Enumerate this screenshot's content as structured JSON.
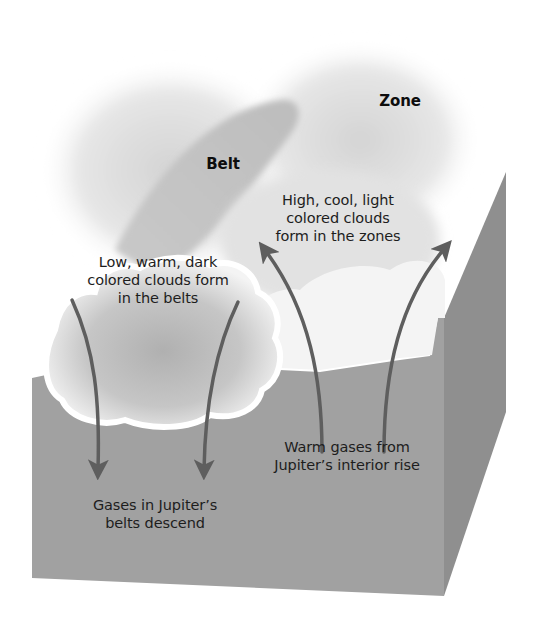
{
  "diagram": {
    "title_labels": {
      "belt": "Belt",
      "zone": "Zone"
    },
    "annotations": {
      "belt_clouds": "Low, warm, dark\ncolored clouds form\nin the belts",
      "zone_clouds": "High, cool, light\ncolored clouds\nform in the zones",
      "belt_gases": "Gases in Jupiter’s\nbelts descend",
      "zone_gases": "Warm gases from\nJupiter’s interior rise"
    },
    "arrows": [
      {
        "id": "belt-left",
        "direction": "down"
      },
      {
        "id": "belt-right",
        "direction": "down"
      },
      {
        "id": "zone-left",
        "direction": "up"
      },
      {
        "id": "zone-right",
        "direction": "up"
      }
    ],
    "colors": {
      "box_front": "#9f9f9f",
      "box_side": "#8c8c8c",
      "arrow": "#5e5e5e",
      "cloud_light": "#f2f2f2",
      "cloud_dark": "#b8b8b8"
    }
  }
}
